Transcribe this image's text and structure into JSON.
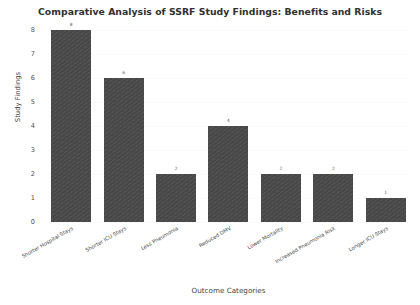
{
  "chart_data": {
    "type": "bar",
    "title": "Comparative Analysis of SSRF Study Findings: Benefits and Risks",
    "xlabel": "Outcome Categories",
    "ylabel": "Study Findings",
    "categories": [
      "Shorter Hospital Stays",
      "Shorter ICU Stays",
      "Less Pneumonia",
      "Reduced DMV",
      "Lower Mortality",
      "Increased Pneumonia Risk",
      "Longer ICU Stays"
    ],
    "values": [
      8,
      6,
      2,
      4,
      2,
      2,
      1
    ],
    "value_labels": [
      "8",
      "6",
      "2",
      "4",
      "2",
      "2",
      "1"
    ],
    "ylim": [
      0,
      8
    ],
    "ytick_labels": [
      "0",
      "1",
      "2",
      "3",
      "4",
      "5",
      "6",
      "7",
      "8"
    ],
    "yticks": [
      0,
      1,
      2,
      3,
      4,
      5,
      6,
      7,
      8
    ],
    "grid": true,
    "legend": false,
    "bar_color": "#494949",
    "background_color": "#ffffff"
  }
}
